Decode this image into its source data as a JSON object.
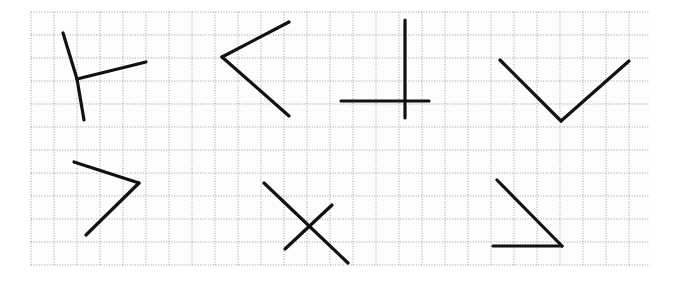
{
  "canvas": {
    "width": 674,
    "height": 284,
    "background_color": "#ffffff",
    "title": "Angle figures on dotted graph paper"
  },
  "grid": {
    "name": "dotted-graph-paper",
    "x": 31,
    "y": 12,
    "width": 619,
    "height": 253,
    "cell_size": 23,
    "columns": 27,
    "rows": 11,
    "line_color": "#9aa0a6",
    "line_style": "dotted",
    "line_width": 1,
    "paper_color": "#fdfdfd"
  },
  "stroke": {
    "color": "#111111",
    "width": 3.2,
    "linecap": "round",
    "linejoin": "round"
  },
  "figures": [
    {
      "id": "figure-1",
      "name": "three-ray-vertex-upper-left",
      "label": "Y-shaped three-ray figure",
      "vertex": [
        77,
        79
      ],
      "segments": [
        {
          "name": "upper-left-ray",
          "x1": 63,
          "y1": 33,
          "x2": 77,
          "y2": 79
        },
        {
          "name": "right-ray",
          "x1": 77,
          "y1": 79,
          "x2": 146,
          "y2": 62
        },
        {
          "name": "lower-ray",
          "x1": 77,
          "y1": 79,
          "x2": 84,
          "y2": 120
        }
      ]
    },
    {
      "id": "figure-2",
      "name": "left-pointing-chevron-upper",
      "label": "Left-pointing angle (less-than shape)",
      "vertex": [
        222,
        57
      ],
      "segments": [
        {
          "name": "upper-arm",
          "x1": 222,
          "y1": 57,
          "x2": 289,
          "y2": 22
        },
        {
          "name": "lower-arm",
          "x1": 222,
          "y1": 57,
          "x2": 289,
          "y2": 116
        }
      ]
    },
    {
      "id": "figure-3",
      "name": "perpendicular-cross-upper",
      "label": "Intersecting perpendicular lines",
      "vertex": [
        405,
        101
      ],
      "segments": [
        {
          "name": "vertical-line",
          "x1": 405,
          "y1": 20,
          "x2": 405,
          "y2": 118
        },
        {
          "name": "horizontal-line",
          "x1": 341,
          "y1": 101,
          "x2": 429,
          "y2": 101
        }
      ]
    },
    {
      "id": "figure-4",
      "name": "v-shape-upper-right",
      "label": "V-shaped angle opening upward",
      "vertex": [
        561,
        121
      ],
      "segments": [
        {
          "name": "left-arm",
          "x1": 500,
          "y1": 60,
          "x2": 561,
          "y2": 121
        },
        {
          "name": "right-arm",
          "x1": 561,
          "y1": 121,
          "x2": 629,
          "y2": 61
        }
      ]
    },
    {
      "id": "figure-5",
      "name": "right-pointing-chevron-lower",
      "label": "Right-pointing angle (greater-than shape)",
      "vertex": [
        139,
        183
      ],
      "segments": [
        {
          "name": "upper-arm",
          "x1": 74,
          "y1": 162,
          "x2": 139,
          "y2": 183
        },
        {
          "name": "lower-arm",
          "x1": 139,
          "y1": 183,
          "x2": 86,
          "y2": 235
        }
      ]
    },
    {
      "id": "figure-6",
      "name": "x-crossing-lower",
      "label": "Two crossing oblique lines forming an X",
      "vertex": [
        308,
        225
      ],
      "segments": [
        {
          "name": "long-diagonal",
          "x1": 264,
          "y1": 183,
          "x2": 348,
          "y2": 263
        },
        {
          "name": "short-diagonal",
          "x1": 285,
          "y1": 249,
          "x2": 332,
          "y2": 205
        }
      ]
    },
    {
      "id": "figure-7",
      "name": "right-angle-lower-right",
      "label": "Right angle with horizontal base and diagonal",
      "vertex": [
        562,
        246
      ],
      "segments": [
        {
          "name": "diagonal-arm",
          "x1": 497,
          "y1": 180,
          "x2": 562,
          "y2": 246
        },
        {
          "name": "horizontal-arm",
          "x1": 493,
          "y1": 246,
          "x2": 562,
          "y2": 246
        }
      ]
    }
  ]
}
